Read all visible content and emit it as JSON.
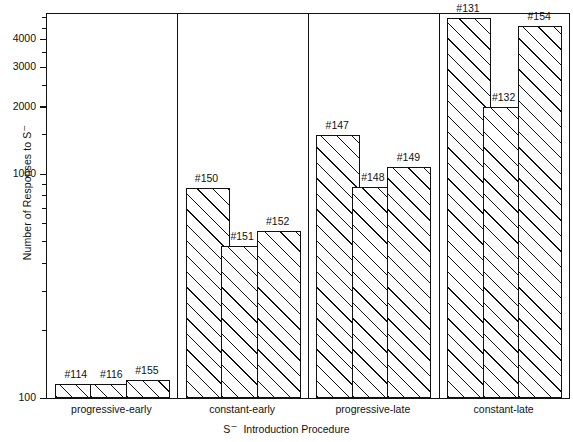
{
  "chart_data": {
    "type": "bar",
    "title": "",
    "xlabel": "S – Introduction Procedure",
    "xlabel_parts": {
      "prefix": "S",
      "superscript": "–",
      "suffix": "Introduction Procedure"
    },
    "ylabel": "Number of Responses to S –",
    "ylabel_parts": {
      "text": "Number of Responses to S",
      "superscript": "–"
    },
    "yscale": "log",
    "ylim": [
      100,
      5200
    ],
    "grid": false,
    "legend": null,
    "y_major_ticks": [
      1000,
      2000,
      3000,
      4000
    ],
    "y_major_ticklabels": [
      "1000",
      "2000",
      "3000",
      "4000"
    ],
    "y_baseline_label": "100",
    "y_minor_ticks": [
      200,
      300,
      400,
      500,
      600,
      700,
      800,
      900,
      1500,
      2500,
      3500,
      4500,
      5000
    ],
    "groups": [
      {
        "label": "progressive-early",
        "bars": [
          {
            "label": "#114",
            "value": 116
          },
          {
            "label": "#116",
            "value": 116
          },
          {
            "label": "#155",
            "value": 120
          }
        ]
      },
      {
        "label": "constant-early",
        "bars": [
          {
            "label": "#150",
            "value": 870
          },
          {
            "label": "#151",
            "value": 480
          },
          {
            "label": "#152",
            "value": 560
          }
        ]
      },
      {
        "label": "progressive-late",
        "bars": [
          {
            "label": "#147",
            "value": 1500
          },
          {
            "label": "#148",
            "value": 880
          },
          {
            "label": "#149",
            "value": 1080
          }
        ]
      },
      {
        "label": "constant-late",
        "bars": [
          {
            "label": "#131",
            "value": 5000
          },
          {
            "label": "#132",
            "value": 2000
          },
          {
            "label": "#154",
            "value": 4600
          }
        ]
      }
    ],
    "categories": [
      "#114",
      "#116",
      "#155",
      "#150",
      "#151",
      "#152",
      "#147",
      "#148",
      "#149",
      "#131",
      "#132",
      "#154"
    ],
    "values": [
      116,
      116,
      120,
      870,
      480,
      560,
      1500,
      880,
      1080,
      5000,
      2000,
      4600
    ],
    "colors": {
      "bar_edge": "#111111",
      "bar_fill": "#ffffff",
      "hatch": "#111111",
      "axis": "#111111",
      "text": "#111111"
    }
  }
}
